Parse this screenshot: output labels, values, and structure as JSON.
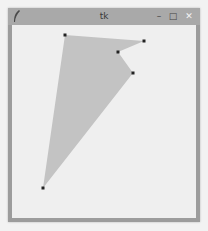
{
  "window": {
    "title": "tk",
    "icon": "feather-icon",
    "controls": {
      "minimize": "–",
      "maximize": "□",
      "close": "✕"
    }
  },
  "canvas": {
    "background": "#efefef",
    "polygon": {
      "fill": "#c3c3c3",
      "vertex_color": "#222222",
      "points": [
        {
          "x": 65,
          "y": 35
        },
        {
          "x": 144,
          "y": 41
        },
        {
          "x": 118,
          "y": 52
        },
        {
          "x": 133,
          "y": 73
        },
        {
          "x": 43,
          "y": 188
        }
      ]
    }
  }
}
